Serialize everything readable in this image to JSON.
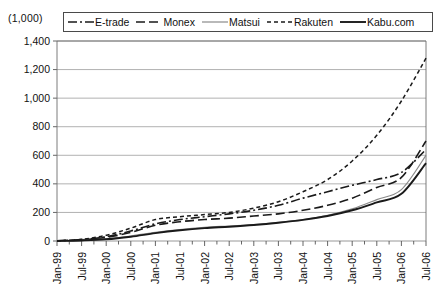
{
  "unit_label": "(1,000)",
  "legend": {
    "entries": [
      {
        "name": "E-trade",
        "style": "long-dash-dot",
        "color": "#1a1a1a",
        "width": 1.6
      },
      {
        "name": "Monex",
        "style": "long-dash",
        "color": "#1a1a1a",
        "width": 1.6
      },
      {
        "name": "Matsui",
        "style": "solid-thin",
        "color": "#8a8a8a",
        "width": 1.2
      },
      {
        "name": "Rakuten",
        "style": "short-dash",
        "color": "#1a1a1a",
        "width": 1.5
      },
      {
        "name": "Kabu.com",
        "style": "solid-thick",
        "color": "#1a1a1a",
        "width": 1.9
      }
    ]
  },
  "chart_data": {
    "type": "line",
    "title": "",
    "xlabel": "",
    "ylabel": "(1,000)",
    "ylim": [
      0,
      1400
    ],
    "yticks": [
      0,
      200,
      400,
      600,
      800,
      1000,
      1200,
      1400
    ],
    "ytick_labels": [
      "0",
      "200",
      "400",
      "600",
      "800",
      "1,000",
      "1,200",
      "1,400"
    ],
    "grid": true,
    "legend_position": "top",
    "x": [
      "Jan-99",
      "Jul-99",
      "Jan-00",
      "Jul-00",
      "Jan-01",
      "Jul-01",
      "Jan-02",
      "Jul-02",
      "Jan-03",
      "Jul-03",
      "Jan-04",
      "Jul-04",
      "Jan-05",
      "Jul-05",
      "Jan-06",
      "Jul-06"
    ],
    "xtick_labels": [
      "Jan-99",
      "Jul-99",
      "Jan-00",
      "Jul-00",
      "Jan-01",
      "Jul-01",
      "Jan-02",
      "Jul-02",
      "Jan-03",
      "Jul-03",
      "Jan-04",
      "Jul-04",
      "Jan-05",
      "Jul-05",
      "Jan-06",
      "Jul-06"
    ],
    "series": [
      {
        "name": "E-trade",
        "values": [
          2,
          10,
          30,
          70,
          120,
          150,
          170,
          190,
          215,
          250,
          300,
          345,
          390,
          430,
          480,
          640
        ]
      },
      {
        "name": "Monex",
        "values": [
          1,
          8,
          25,
          60,
          110,
          135,
          150,
          160,
          175,
          190,
          215,
          250,
          300,
          375,
          445,
          700
        ]
      },
      {
        "name": "Matsui",
        "values": [
          0,
          5,
          15,
          35,
          60,
          80,
          95,
          105,
          115,
          130,
          150,
          180,
          225,
          290,
          360,
          600
        ]
      },
      {
        "name": "Rakuten",
        "values": [
          1,
          12,
          40,
          90,
          150,
          170,
          185,
          200,
          230,
          275,
          345,
          430,
          560,
          740,
          980,
          1280
        ]
      },
      {
        "name": "Kabu.com",
        "values": [
          0,
          4,
          12,
          30,
          55,
          75,
          90,
          100,
          112,
          128,
          148,
          175,
          215,
          270,
          330,
          545
        ]
      }
    ]
  }
}
